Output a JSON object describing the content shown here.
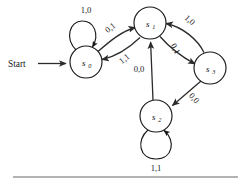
{
  "figure": {
    "type": "state-transition-diagram",
    "width": 244,
    "height": 184,
    "background": "#ffffff",
    "ink_color": "#1a1a1a",
    "rule_color": "#9a9a9a"
  },
  "start": {
    "label": "Start",
    "target": "s0"
  },
  "states": [
    {
      "id": "s0",
      "name": "s",
      "subscript": "0",
      "cx": 86,
      "cy": 62,
      "r": 16
    },
    {
      "id": "s1",
      "name": "s",
      "subscript": "1",
      "cx": 150,
      "cy": 23,
      "r": 16
    },
    {
      "id": "s2",
      "name": "s",
      "subscript": "2",
      "cx": 156,
      "cy": 116,
      "r": 16
    },
    {
      "id": "s3",
      "name": "s",
      "subscript": "3",
      "cx": 210,
      "cy": 68,
      "r": 16
    }
  ],
  "transitions": [
    {
      "id": "t-s0-s0",
      "from": "s0",
      "to": "s0",
      "label": "1,0",
      "kind": "self-loop",
      "label_x": 86,
      "label_y": 13,
      "rotation": 0
    },
    {
      "id": "t-s0-s1",
      "from": "s0",
      "to": "s1",
      "label": "0,1",
      "kind": "curve",
      "label_x": 112,
      "label_y": 30,
      "rotation": -38
    },
    {
      "id": "t-s1-s0",
      "from": "s1",
      "to": "s0",
      "label": "1,1",
      "kind": "curve",
      "label_x": 126,
      "label_y": 61,
      "rotation": -38
    },
    {
      "id": "t-s3-s1",
      "from": "s3",
      "to": "s1",
      "label": "1,0",
      "kind": "curve",
      "label_x": 188,
      "label_y": 22,
      "rotation": 42
    },
    {
      "id": "t-s1-s3",
      "from": "s1",
      "to": "s3",
      "label": "0,1",
      "kind": "curve",
      "label_x": 173,
      "label_y": 50,
      "rotation": 62
    },
    {
      "id": "t-s3-s2",
      "from": "s3",
      "to": "s2",
      "label": "0,0",
      "kind": "straight",
      "label_x": 192,
      "label_y": 100,
      "rotation": 48
    },
    {
      "id": "t-s2-s1",
      "from": "s2",
      "to": "s1",
      "label": "0,0",
      "kind": "straight",
      "label_x": 139,
      "label_y": 72,
      "rotation": 0
    },
    {
      "id": "t-s2-s2",
      "from": "s2",
      "to": "s2",
      "label": "1,1",
      "kind": "self-loop",
      "label_x": 156,
      "label_y": 168,
      "rotation": 0
    }
  ],
  "bottom_rule": {
    "x1": 13,
    "x2": 238,
    "y": 176
  }
}
